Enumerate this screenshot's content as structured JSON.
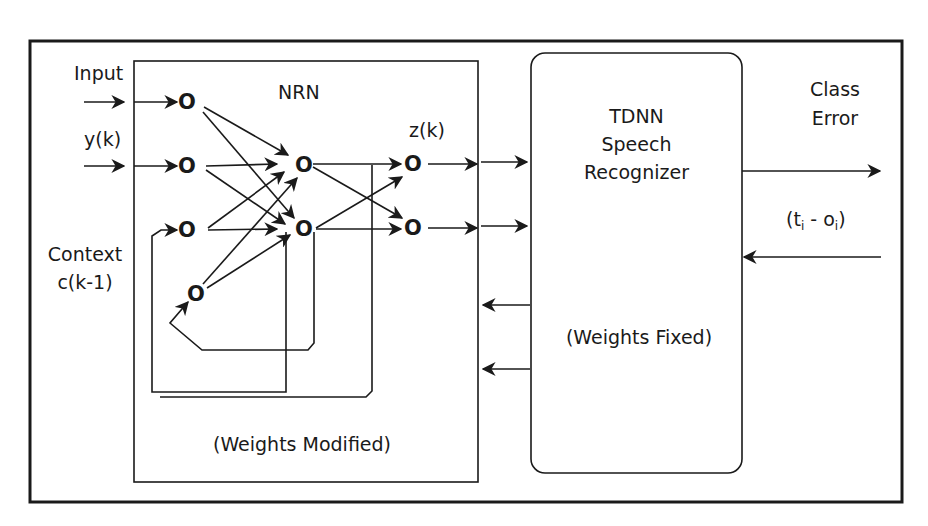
{
  "nrn": {
    "title": "NRN",
    "caption": "(Weights Modified)",
    "output_label": "z(k)",
    "node_glyph": "O"
  },
  "inputs": {
    "input_label": "Input",
    "y_label": "y(k)",
    "context_label_line1": "Context",
    "context_label_line2": "c(k-1)"
  },
  "tdnn": {
    "title_line1": "TDNN",
    "title_line2": "Speech",
    "title_line3": "Recognizer",
    "caption": "(Weights Fixed)"
  },
  "outputs": {
    "class_line1": "Class",
    "class_line2": "Error",
    "error_t": "t",
    "error_sub_i": "i",
    "error_minus": " - ",
    "error_o": "o",
    "error_sub_i2": "i",
    "error_open": "(",
    "error_close": ")"
  },
  "colors": {
    "line": "#1a1a1a",
    "background": "#ffffff"
  }
}
